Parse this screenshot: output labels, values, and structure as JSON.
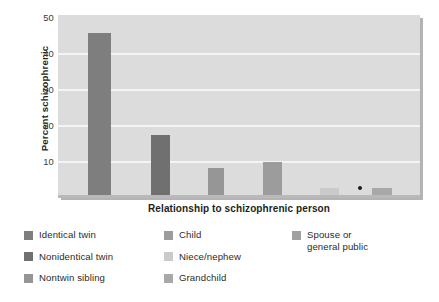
{
  "chart_data": {
    "type": "bar",
    "title": "",
    "xlabel": "Relationship to schizophrenic person",
    "ylabel": "Percent schizophrenic",
    "categories": [
      "Identical twin",
      "Nonidentical twin",
      "Nontwin sibling",
      "Child",
      "Niece/nephew",
      "Grandchild",
      "Spouse or general public"
    ],
    "values": [
      45,
      17,
      8,
      9.5,
      2.5,
      2.5,
      1
    ],
    "ylim": [
      0,
      50
    ],
    "yticks": [
      50,
      40,
      30,
      20,
      10
    ],
    "ytick_labels": [
      "50",
      "40",
      "30",
      "20",
      "10"
    ],
    "grid": "horizontal",
    "legend_position": "below-plot",
    "bar_colors": [
      "#7e7e7e",
      "#707070",
      "#969696",
      "#9c9c9c",
      "#cacaca",
      "#a8a8a8",
      "#b0b0b0"
    ],
    "plot_background": "#dcdcdc",
    "gridline_color": "#f4f4f4",
    "annotations": [
      "small black dot between Niece/nephew and Grandchild bars"
    ]
  },
  "axes": {
    "y_title": "Percent schizophrenic",
    "x_title": "Relationship to schizophrenic person",
    "y_tick_labels": [
      "50",
      "40",
      "30",
      "20",
      "10"
    ]
  },
  "legend": {
    "columns": [
      {
        "items": [
          {
            "label": "Identical twin",
            "color": "#7e7e7e"
          },
          {
            "label": "Nonidentical twin",
            "color": "#707070"
          },
          {
            "label": "Nontwin sibling",
            "color": "#969696"
          }
        ]
      },
      {
        "items": [
          {
            "label": "Child",
            "color": "#9c9c9c"
          },
          {
            "label": "Niece/nephew",
            "color": "#cacaca"
          },
          {
            "label": "Grandchild",
            "color": "#a8a8a8"
          }
        ]
      },
      {
        "items": [
          {
            "label": "Spouse or\ngeneral public",
            "color": "#a0a0a0"
          }
        ]
      }
    ]
  }
}
